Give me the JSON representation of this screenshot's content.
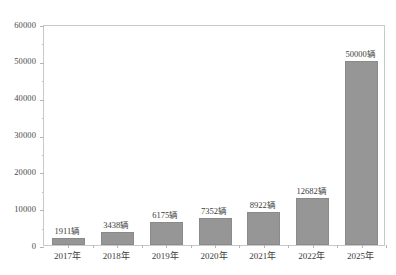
{
  "chart_data": {
    "type": "bar",
    "title": "",
    "subtitle": "",
    "xlabel": "",
    "ylabel": "",
    "categories": [
      "2017年",
      "2018年",
      "2019年",
      "2020年",
      "2021年",
      "2022年",
      "2025年"
    ],
    "values": [
      1911,
      3438,
      6175,
      7352,
      8922,
      12682,
      50000
    ],
    "data_labels": [
      "1911辆",
      "3438辆",
      "6175辆",
      "7352辆",
      "8922辆",
      "12682辆",
      "50000辆"
    ],
    "unit_suffix": "辆",
    "ylim": [
      0,
      60000
    ],
    "y_major_ticks": [
      0,
      10000,
      20000,
      30000,
      40000,
      50000,
      60000
    ],
    "y_tick_labels": [
      "0",
      "10000",
      "20000",
      "30000",
      "40000",
      "50000",
      "60000"
    ],
    "y_minor_tick_interval": 5000,
    "grid": false,
    "legend": null,
    "legend_position": "none",
    "series": [
      {
        "name": "",
        "values": [
          1911,
          3438,
          6175,
          7352,
          8922,
          12682,
          50000
        ]
      }
    ]
  },
  "style": {
    "bar_fill": "#969696",
    "bar_border": "#8a8a8a",
    "frame_border": "#c9c9c9",
    "text_color": "#3c3c3c",
    "axis_label_color": "#4a4a4a",
    "background": "#ffffff"
  }
}
